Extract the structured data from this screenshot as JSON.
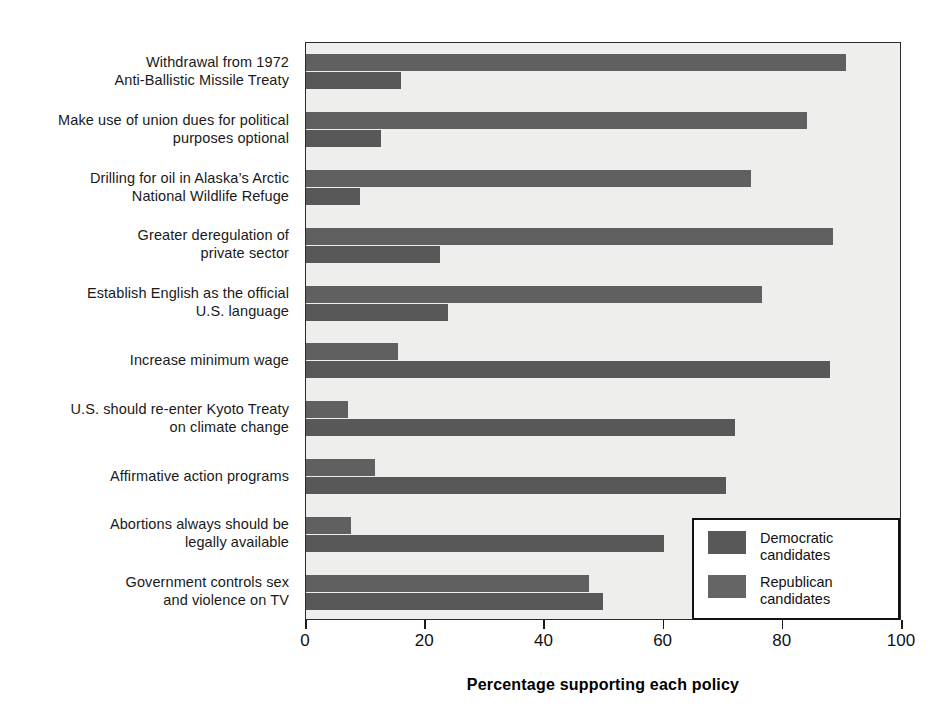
{
  "chart_data": {
    "type": "bar",
    "orientation": "horizontal",
    "title": "",
    "xlabel": "Percentage supporting each policy",
    "ylabel": "",
    "xlim": [
      0,
      100
    ],
    "xticks": [
      0,
      20,
      40,
      60,
      80,
      100
    ],
    "grid": false,
    "legend_position": "inside-bottom-right",
    "categories": [
      [
        "Withdrawal from 1972",
        "Anti-Ballistic Missile Treaty"
      ],
      [
        "Make use of union dues for political",
        "purposes optional"
      ],
      [
        "Drilling for oil in Alaska’s Arctic",
        "National Wildlife Refuge"
      ],
      [
        "Greater deregulation of",
        "private sector"
      ],
      [
        "Establish English as the official",
        "U.S. language"
      ],
      [
        "Increase minimum wage"
      ],
      [
        "U.S. should re-enter Kyoto Treaty",
        "on climate change"
      ],
      [
        "Affirmative action programs"
      ],
      [
        "Abortions always should be",
        "legally available"
      ],
      [
        "Government controls sex",
        "and violence on TV"
      ]
    ],
    "series": [
      {
        "name": "Republican candidates",
        "color": "#606060",
        "values": [
          90.6,
          84.0,
          74.7,
          88.5,
          76.5,
          15.5,
          7.0,
          11.5,
          7.6,
          47.4
        ]
      },
      {
        "name": "Democratic candidates",
        "color": "#585858",
        "values": [
          16.0,
          12.6,
          9.0,
          22.5,
          23.8,
          88.0,
          72.0,
          70.5,
          60.0,
          49.8
        ]
      }
    ]
  },
  "legend": {
    "items": [
      {
        "key": "dem",
        "line1": "Democratic",
        "line2": "candidates"
      },
      {
        "key": "rep",
        "line1": "Republican",
        "line2": "candidates"
      }
    ]
  },
  "axis": {
    "tick_labels": [
      "0",
      "20",
      "40",
      "60",
      "80",
      "100"
    ],
    "x_axis_title": "Percentage supporting each policy"
  }
}
